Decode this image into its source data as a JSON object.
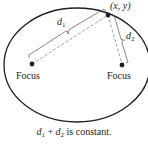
{
  "diagram": {
    "type": "ellipse-foci",
    "point_label": "(x, y)",
    "d1_label": "d",
    "d1_sub": "1",
    "d2_label": "d",
    "d2_sub": "2",
    "focus_left_label": "Focus",
    "focus_right_label": "Focus",
    "caption": {
      "d1": "d",
      "d1_sub": "1",
      "plus": " + ",
      "d2": "d",
      "d2_sub": "2",
      "rest": " is constant."
    },
    "colors": {
      "stroke": "#231f20",
      "dashed": "#808080"
    }
  }
}
